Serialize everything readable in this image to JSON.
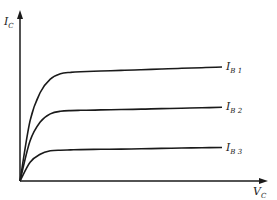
{
  "chart_data": {
    "type": "line",
    "title": "",
    "xlabel": {
      "main": "V",
      "sub": "C"
    },
    "ylabel": {
      "main": "I",
      "sub": "C"
    },
    "grid": false,
    "legend": "inline-right",
    "x": [
      0,
      0.05,
      0.1,
      0.15,
      0.2,
      0.25,
      0.3,
      0.4,
      0.5,
      0.6,
      0.7,
      0.8,
      0.9,
      1.0
    ],
    "series": [
      {
        "name": "I_B1",
        "label_main": "I",
        "label_sub": "B 1",
        "values": [
          0,
          0.45,
          0.66,
          0.76,
          0.8,
          0.81,
          0.815,
          0.82,
          0.825,
          0.83,
          0.835,
          0.84,
          0.845,
          0.85
        ]
      },
      {
        "name": "I_B2",
        "label_main": "I",
        "label_sub": "B 2",
        "values": [
          0,
          0.3,
          0.44,
          0.5,
          0.52,
          0.525,
          0.527,
          0.53,
          0.533,
          0.536,
          0.54,
          0.543,
          0.546,
          0.55
        ]
      },
      {
        "name": "I_B3",
        "label_main": "I",
        "label_sub": "B 3",
        "values": [
          0,
          0.14,
          0.2,
          0.225,
          0.23,
          0.232,
          0.234,
          0.236,
          0.238,
          0.24,
          0.243,
          0.246,
          0.248,
          0.25
        ]
      }
    ],
    "xlim": [
      0,
      1.1
    ],
    "ylim": [
      0,
      1.2
    ],
    "line_color": "#1a1a1a"
  }
}
